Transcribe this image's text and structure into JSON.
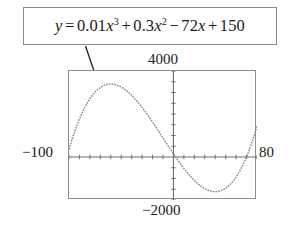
{
  "figure": {
    "callout": {
      "equation_plain": "y = 0.01x^3 + 0.3x^2 - 72x + 150",
      "lhs": "y",
      "equals": "=",
      "term1_coeff": "0.01",
      "term1_var": "x",
      "term1_exp": "3",
      "op1": "+",
      "term2_coeff": "0.3",
      "term2_var": "x",
      "term2_exp": "2",
      "op2": "−",
      "term3_coeff": "72",
      "term3_var": "x",
      "op3": "+",
      "term4_const": "150"
    },
    "labels": {
      "ymax": "4000",
      "ymin": "−2000",
      "xmin": "−100",
      "xmax": "80"
    },
    "colors": {
      "frame": "#8f8f8f",
      "box_border": "#8a8a8a",
      "axis": "#6e6e6e",
      "curve": "#7a7a7a",
      "text": "#191919",
      "background": "#ffffff"
    }
  },
  "chart_data": {
    "type": "line",
    "title": "",
    "xlabel": "",
    "ylabel": "",
    "equation": "y = 0.01x^3 + 0.3x^2 - 72x + 150",
    "coefficients": {
      "x3": 0.01,
      "x2": 0.3,
      "x1": -72,
      "x0": 150
    },
    "xlim": [
      -100,
      80
    ],
    "ylim": [
      -2000,
      4000
    ],
    "xtick_step": 10,
    "ytick_step": 500,
    "grid": false,
    "legend": null,
    "line_style": "dotted",
    "axis_tick_marks": true,
    "annotations": [
      {
        "text": "4000",
        "position": "above-plot-center",
        "meaning": "Ymax"
      },
      {
        "text": "−2000",
        "position": "below-plot-center",
        "meaning": "Ymin"
      },
      {
        "text": "−100",
        "position": "left-of-plot",
        "meaning": "Xmin"
      },
      {
        "text": "80",
        "position": "right-of-plot",
        "meaning": "Xmax"
      },
      {
        "text": "y = 0.01x^3 + 0.3x^2 - 72x + 150",
        "position": "callout-box-above",
        "meaning": "equation of plotted curve"
      }
    ],
    "features": {
      "local_maximum": {
        "x": -60,
        "y": 3390
      },
      "local_minimum": {
        "x": 40,
        "y": -2090
      }
    },
    "x": [
      -100,
      -95,
      -90,
      -85,
      -80,
      -75,
      -70,
      -65,
      -60,
      -55,
      -50,
      -45,
      -40,
      -35,
      -30,
      -25,
      -20,
      -15,
      -10,
      -5,
      0,
      5,
      10,
      15,
      20,
      25,
      30,
      35,
      40,
      45,
      50,
      55,
      60,
      65,
      70,
      75,
      80
    ],
    "y": [
      4350,
      4268,
      4080,
      3798,
      3430,
      2988,
      2480,
      1918,
      1310,
      668,
      0,
      -683,
      -1370,
      -2053,
      -2720,
      -3363,
      -3970,
      -4533,
      -5040,
      -5483,
      150,
      -208,
      -556,
      -881,
      -1170,
      -1413,
      -1596,
      -1709,
      -1738,
      -1673,
      -1500,
      -1209,
      -786,
      -222,
      497,
      1381,
      2438
    ]
  }
}
